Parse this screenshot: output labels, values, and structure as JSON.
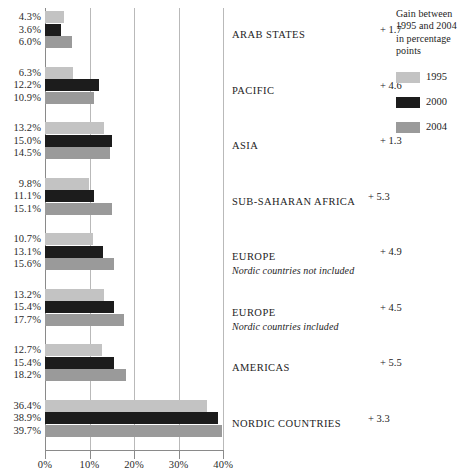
{
  "chart_data": {
    "type": "bar",
    "orientation": "horizontal",
    "title": "",
    "xlabel": "",
    "ylabel": "",
    "xlim": [
      0,
      42
    ],
    "xticks": [
      "0%",
      "10%",
      "20%",
      "30%",
      "40%"
    ],
    "xtick_values": [
      0,
      10,
      20,
      30,
      40
    ],
    "grid": "vertical",
    "legend_position": "top-right",
    "legend_title": "Gain between 1995 and 2004 in percentage points",
    "series": [
      {
        "name": "1995",
        "color": "#c3c3c3",
        "values": [
          4.3,
          6.3,
          13.2,
          9.8,
          10.7,
          13.2,
          12.7,
          36.4
        ]
      },
      {
        "name": "2000",
        "color": "#1c1c1c",
        "values": [
          3.6,
          12.2,
          15.0,
          11.1,
          13.1,
          15.4,
          15.4,
          38.9
        ]
      },
      {
        "name": "2004",
        "color": "#9a9a9a",
        "values": [
          6.0,
          10.9,
          14.5,
          15.1,
          15.6,
          17.7,
          18.2,
          39.7
        ]
      }
    ],
    "categories": [
      "ARAB STATES",
      "PACIFIC",
      "ASIA",
      "SUB-SAHARAN AFRICA",
      "EUROPE",
      "EUROPE",
      "AMERICAS",
      "NORDIC COUNTRIES"
    ],
    "groups": [
      {
        "name": "ARAB STATES",
        "subtitle": "",
        "gain": "+ 1.7",
        "gain_tight": false,
        "values": [
          {
            "year": "1995",
            "label": "4.3%",
            "value": 4.3
          },
          {
            "year": "2000",
            "label": "3.6%",
            "value": 3.6
          },
          {
            "year": "2004",
            "label": "6.0%",
            "value": 6.0
          }
        ]
      },
      {
        "name": "PACIFIC",
        "subtitle": "",
        "gain": "+ 4.6",
        "gain_tight": false,
        "values": [
          {
            "year": "1995",
            "label": "6.3%",
            "value": 6.3
          },
          {
            "year": "2000",
            "label": "12.2%",
            "value": 12.2
          },
          {
            "year": "2004",
            "label": "10.9%",
            "value": 10.9
          }
        ]
      },
      {
        "name": "ASIA",
        "subtitle": "",
        "gain": "+ 1.3",
        "gain_tight": false,
        "values": [
          {
            "year": "1995",
            "label": "13.2%",
            "value": 13.2
          },
          {
            "year": "2000",
            "label": "15.0%",
            "value": 15.0
          },
          {
            "year": "2004",
            "label": "14.5%",
            "value": 14.5
          }
        ]
      },
      {
        "name": "SUB-SAHARAN AFRICA",
        "subtitle": "",
        "gain": "+ 5.3",
        "gain_tight": true,
        "values": [
          {
            "year": "1995",
            "label": "9.8%",
            "value": 9.8
          },
          {
            "year": "2000",
            "label": "11.1%",
            "value": 11.1
          },
          {
            "year": "2004",
            "label": "15.1%",
            "value": 15.1
          }
        ]
      },
      {
        "name": "EUROPE",
        "subtitle": "Nordic countries not included",
        "gain": "+ 4.9",
        "gain_tight": false,
        "values": [
          {
            "year": "1995",
            "label": "10.7%",
            "value": 10.7
          },
          {
            "year": "2000",
            "label": "13.1%",
            "value": 13.1
          },
          {
            "year": "2004",
            "label": "15.6%",
            "value": 15.6
          }
        ]
      },
      {
        "name": "EUROPE",
        "subtitle": "Nordic countries included",
        "gain": "+ 4.5",
        "gain_tight": false,
        "values": [
          {
            "year": "1995",
            "label": "13.2%",
            "value": 13.2
          },
          {
            "year": "2000",
            "label": "15.4%",
            "value": 15.4
          },
          {
            "year": "2004",
            "label": "17.7%",
            "value": 17.7
          }
        ]
      },
      {
        "name": "AMERICAS",
        "subtitle": "",
        "gain": "+ 5.5",
        "gain_tight": false,
        "values": [
          {
            "year": "1995",
            "label": "12.7%",
            "value": 12.7
          },
          {
            "year": "2000",
            "label": "15.4%",
            "value": 15.4
          },
          {
            "year": "2004",
            "label": "18.2%",
            "value": 18.2
          }
        ]
      },
      {
        "name": "NORDIC COUNTRIES",
        "subtitle": "",
        "gain": "+ 3.3",
        "gain_tight": true,
        "values": [
          {
            "year": "1995",
            "label": "36.4%",
            "value": 36.4
          },
          {
            "year": "2000",
            "label": "38.9%",
            "value": 38.9
          },
          {
            "year": "2004",
            "label": "39.7%",
            "value": 39.7
          }
        ]
      }
    ]
  },
  "legend": {
    "title": "Gain between 1995 and 2004 in percentage points",
    "items": [
      {
        "label": "1995",
        "color": "#c3c3c3"
      },
      {
        "label": "2000",
        "color": "#1c1c1c"
      },
      {
        "label": "2004",
        "color": "#9a9a9a"
      }
    ]
  },
  "axis": {
    "ticks": [
      "0%",
      "10%",
      "20%",
      "30%",
      "40%"
    ]
  }
}
